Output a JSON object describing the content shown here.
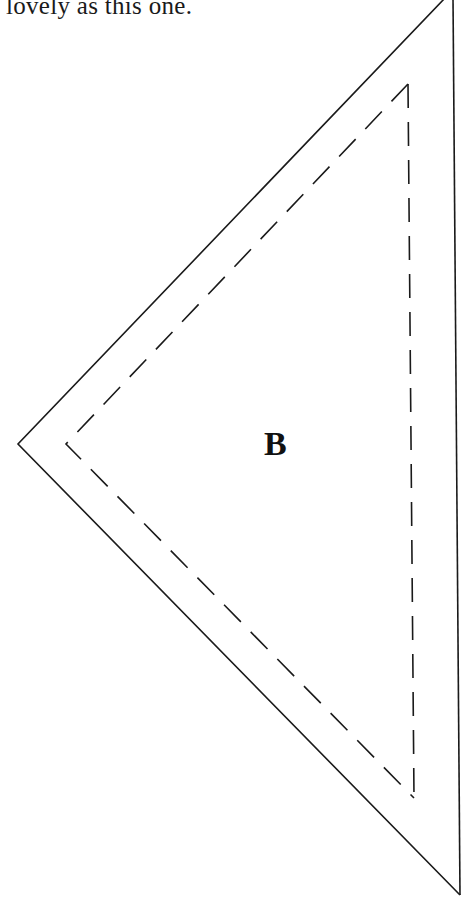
{
  "text": {
    "line": "lovely as this one."
  },
  "pattern_piece": {
    "label": "B",
    "outer_cut_line": {
      "points": [
        [
          445,
          -2
        ],
        [
          18,
          444
        ],
        [
          460,
          895
        ],
        [
          453,
          -2
        ]
      ],
      "style": "solid"
    },
    "inner_seam_line": {
      "points": [
        [
          408,
          84
        ],
        [
          66,
          444
        ],
        [
          414,
          798
        ]
      ],
      "style": "dashed"
    },
    "line_color": "#1a1a1a"
  }
}
